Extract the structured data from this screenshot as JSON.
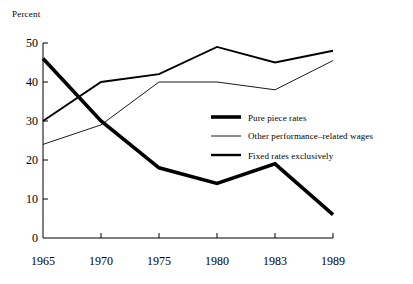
{
  "chart_data": {
    "type": "line",
    "title": "",
    "xlabel": "",
    "ylabel": "Percent",
    "categories": [
      "1965",
      "1970",
      "1975",
      "1980",
      "1983",
      "1989"
    ],
    "ylim": [
      0,
      50
    ],
    "yticks": [
      0,
      10,
      20,
      30,
      40,
      50
    ],
    "grid": false,
    "legend_position": "center-right",
    "series": [
      {
        "name": "Pure piece rates",
        "style": "thick",
        "values": [
          46,
          30,
          18,
          14,
          19,
          6
        ]
      },
      {
        "name": "Other performance-related wages",
        "style": "thin",
        "values": [
          24,
          29,
          40,
          40,
          38,
          45.5
        ]
      },
      {
        "name": "Fixed rates exclusively",
        "style": "medium",
        "values": [
          30,
          40,
          42,
          49,
          45,
          48
        ]
      }
    ]
  },
  "axis": {
    "y_label": "Percent",
    "y_ticks": [
      "50",
      "40",
      "30",
      "20",
      "10",
      "0"
    ],
    "x_ticks": [
      "1965",
      "1970",
      "1975",
      "1980",
      "1983",
      "1989"
    ]
  },
  "legend": {
    "items": [
      {
        "label": "Pure piece rates",
        "swatch": "thick-line-swatch"
      },
      {
        "label": "Other performance–related wages",
        "swatch": "thin-line-swatch"
      },
      {
        "label": "Fixed rates exclusively",
        "swatch": "medium-line-swatch"
      }
    ]
  },
  "colors": {
    "ink": "#000000",
    "background": "#ffffff"
  }
}
